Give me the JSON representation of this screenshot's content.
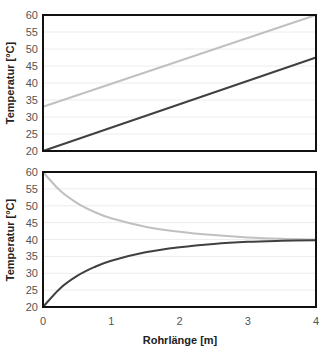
{
  "chart_data": [
    {
      "type": "line",
      "title": "",
      "xlabel": "",
      "ylabel": "Temperatur [°C]",
      "xlim": [
        0,
        4
      ],
      "ylim": [
        20,
        60
      ],
      "yticks": [
        20,
        25,
        30,
        35,
        40,
        45,
        50,
        55,
        60
      ],
      "grid": true,
      "legend": null,
      "series": [
        {
          "name": "hot (light gray)",
          "color": "#c0c0c0",
          "x": [
            0,
            4
          ],
          "values": [
            33,
            60
          ]
        },
        {
          "name": "cold (dark gray)",
          "color": "#404040",
          "x": [
            0,
            4
          ],
          "values": [
            20,
            47.5
          ]
        }
      ]
    },
    {
      "type": "line",
      "title": "",
      "xlabel": "Rohrlänge [m]",
      "ylabel": "Temperatur [°C]",
      "xlim": [
        0,
        4
      ],
      "ylim": [
        20,
        60
      ],
      "xticks": [
        0,
        1,
        2,
        3,
        4
      ],
      "yticks": [
        20,
        25,
        30,
        35,
        40,
        45,
        50,
        55,
        60
      ],
      "grid": true,
      "legend": null,
      "series": [
        {
          "name": "hot (light gray)",
          "color": "#c0c0c0",
          "x": [
            0,
            0.25,
            0.5,
            0.75,
            1,
            1.5,
            2,
            2.5,
            3,
            3.5,
            4
          ],
          "values": [
            60,
            54.5,
            50.8,
            48.2,
            46.3,
            43.8,
            42.3,
            41.3,
            40.6,
            40.2,
            40.0
          ]
        },
        {
          "name": "cold (dark gray)",
          "color": "#404040",
          "x": [
            0,
            0.25,
            0.5,
            0.75,
            1,
            1.5,
            2,
            2.5,
            3,
            3.5,
            4
          ],
          "values": [
            20,
            25.5,
            29.2,
            31.8,
            33.7,
            36.2,
            37.7,
            38.7,
            39.3,
            39.6,
            39.8
          ]
        }
      ]
    }
  ],
  "labels": {
    "ylabel_top": "Temperatur [°C]",
    "ylabel_bottom": "Temperatur [°C]",
    "xlabel": "Rohrlänge [m]",
    "yticks": [
      "20",
      "25",
      "30",
      "35",
      "40",
      "45",
      "50",
      "55",
      "60"
    ],
    "xticks": [
      "0",
      "1",
      "2",
      "3",
      "4"
    ]
  }
}
